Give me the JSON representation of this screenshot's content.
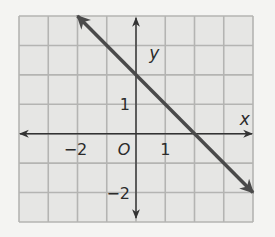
{
  "chart_data": {
    "type": "line",
    "title": "",
    "xlabel": "x",
    "ylabel": "y",
    "origin_label": "O",
    "xlim": [
      -4,
      4
    ],
    "ylim": [
      -3,
      4
    ],
    "grid": true,
    "x_tick_labels": [
      {
        "value": -2,
        "text": "−2"
      },
      {
        "value": 1,
        "text": "1"
      }
    ],
    "y_tick_labels": [
      {
        "value": 1,
        "text": "1"
      },
      {
        "value": -2,
        "text": "−2"
      }
    ],
    "series": [
      {
        "name": "line",
        "equation": "y = -x + 2",
        "points": [
          [
            -2,
            4
          ],
          [
            0,
            2
          ],
          [
            2,
            0
          ],
          [
            4,
            -2
          ]
        ],
        "arrows_both_ends": true
      }
    ],
    "colors": {
      "background": "#f4f4f2",
      "grid_fill": "#e6e6e4",
      "grid_line": "#b4b4b2",
      "axis": "#333333",
      "line": "#4a4a4a"
    }
  }
}
